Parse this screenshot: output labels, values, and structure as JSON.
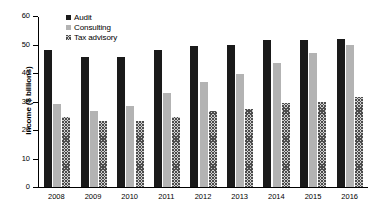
{
  "chart_data": {
    "type": "bar",
    "title": "",
    "subtitle": "",
    "xlabel": "",
    "ylabel": "Income ($ billions)",
    "ylim": [
      0,
      60
    ],
    "yticks": [
      0,
      10,
      20,
      30,
      40,
      50,
      60
    ],
    "ytick_labels": [
      "0",
      "10",
      "20",
      "30",
      "40",
      "50",
      "60"
    ],
    "grid": false,
    "legend_position": "top-left",
    "categories": [
      "2008",
      "2009",
      "2010",
      "2011",
      "2012",
      "2013",
      "2014",
      "2015",
      "2016"
    ],
    "series": [
      {
        "name": "Audit",
        "color": "#1a1a1a",
        "pattern": "solid",
        "values": [
          48,
          45.5,
          45.5,
          48,
          49.5,
          50,
          51.5,
          51.5,
          52
        ]
      },
      {
        "name": "Consulting",
        "color": "#b3b3b3",
        "pattern": "solid",
        "values": [
          29,
          26.5,
          28.5,
          33,
          37,
          39.5,
          43.5,
          47,
          50
        ]
      },
      {
        "name": "Tax advisory",
        "color": "#d0d0d0",
        "pattern": "crosshatch",
        "values": [
          24.5,
          23,
          23,
          24.5,
          26.5,
          27.5,
          29.5,
          30,
          31.5
        ]
      }
    ]
  }
}
